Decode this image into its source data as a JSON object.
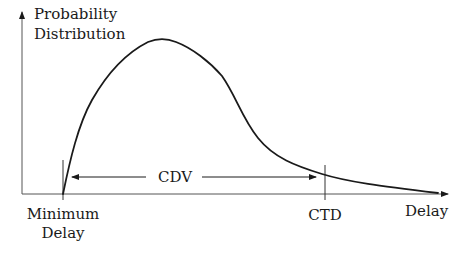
{
  "diagram": {
    "y_axis_label_line1": "Probability",
    "y_axis_label_line2": "Distribution",
    "x_axis_label": "Delay",
    "min_delay_label_line1": "Minimum",
    "min_delay_label_line2": "Delay",
    "ctd_label": "CTD",
    "cdv_label": "CDV",
    "colors": {
      "line": "#1a1a1a",
      "axis": "#333333",
      "background": "#ffffff"
    }
  }
}
